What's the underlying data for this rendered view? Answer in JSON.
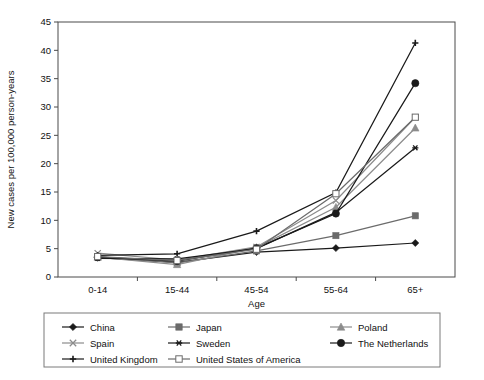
{
  "chart_data": {
    "type": "line",
    "title": "",
    "xlabel": "Age",
    "ylabel": "New cases per 100,000 person-years",
    "categories": [
      "0-14",
      "15-44",
      "45-54",
      "55-64",
      "65+"
    ],
    "ylim": [
      0,
      45
    ],
    "ytick_labels": [
      "0",
      "5",
      "10",
      "15",
      "20",
      "25",
      "30",
      "35",
      "40",
      "45"
    ],
    "yticks": [
      0,
      5,
      10,
      15,
      20,
      25,
      30,
      35,
      40,
      45
    ],
    "grid": false,
    "legend_position": "bottom",
    "series": [
      {
        "name": "China",
        "marker": "filled-diamond",
        "color": "#1a1a1a",
        "values": [
          3.4,
          2.6,
          4.4,
          5.1,
          6.0
        ]
      },
      {
        "name": "Japan",
        "marker": "filled-square",
        "color": "#6b6b6b",
        "values": [
          3.6,
          2.5,
          4.6,
          7.3,
          10.8
        ]
      },
      {
        "name": "Poland",
        "marker": "filled-triangle",
        "color": "#8c8c8c",
        "values": [
          3.5,
          2.2,
          5.2,
          12.3,
          26.3
        ]
      },
      {
        "name": "Spain",
        "marker": "cross-x",
        "color": "#8c8c8c",
        "values": [
          4.2,
          3.0,
          5.3,
          13.5,
          28.2
        ]
      },
      {
        "name": "Sweden",
        "marker": "asterisk",
        "color": "#1a1a1a",
        "values": [
          3.3,
          3.2,
          5.0,
          11.4,
          22.8
        ]
      },
      {
        "name": "The Netherlands",
        "marker": "filled-circle",
        "color": "#1a1a1a",
        "values": [
          3.5,
          2.8,
          5.1,
          11.2,
          34.2
        ]
      },
      {
        "name": "United Kingdom",
        "marker": "plus",
        "color": "#1a1a1a",
        "values": [
          3.8,
          4.1,
          8.1,
          14.9,
          41.3
        ]
      },
      {
        "name": "United States of America",
        "marker": "open-square",
        "color": "#6b6b6b",
        "values": [
          3.6,
          2.9,
          4.9,
          14.7,
          28.2
        ]
      }
    ]
  },
  "legend": {
    "entries": [
      {
        "label": "China",
        "marker": "filled-diamond"
      },
      {
        "label": "Japan",
        "marker": "filled-square"
      },
      {
        "label": "Poland",
        "marker": "filled-triangle"
      },
      {
        "label": "Spain",
        "marker": "cross-x"
      },
      {
        "label": "Sweden",
        "marker": "asterisk"
      },
      {
        "label": "The Netherlands",
        "marker": "filled-circle"
      },
      {
        "label": "United Kingdom",
        "marker": "plus"
      },
      {
        "label": "United States of America",
        "marker": "open-square"
      }
    ]
  },
  "colors": {
    "axis": "#4a4a4a",
    "text": "#111111",
    "dark_series": "#1a1a1a",
    "mid_series": "#6b6b6b",
    "light_series": "#8c8c8c",
    "legend_border": "#7a7a7a",
    "background": "#ffffff"
  }
}
